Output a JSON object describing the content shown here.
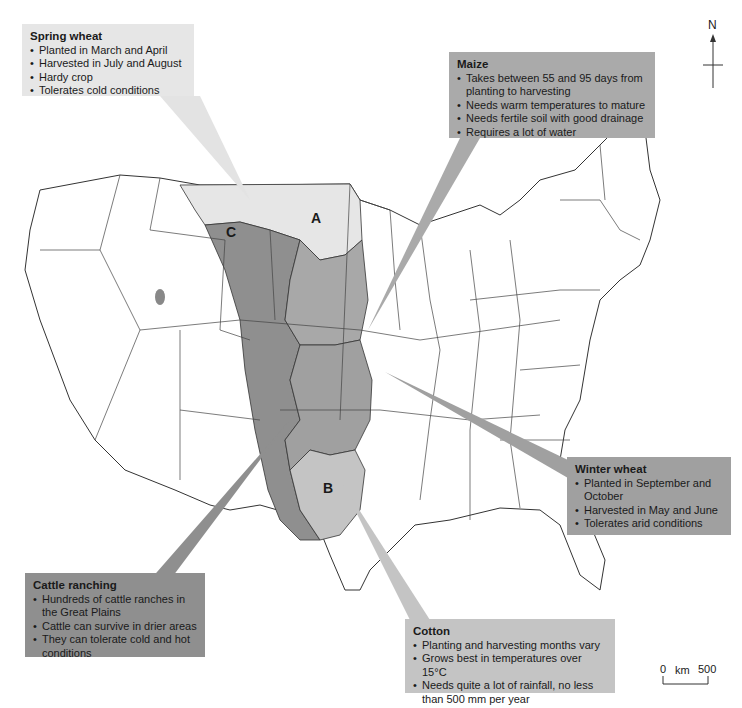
{
  "map": {
    "title": "Agricultural regions of the United States",
    "colors": {
      "land": "#ffffff",
      "border": "#333333",
      "spring_wheat": "#e6e6e6",
      "maize": "#a8a8a8",
      "winter_wheat": "#a0a0a0",
      "cattle": "#8f8f8f",
      "cotton": "#c4c4c4"
    },
    "region_labels": {
      "a": "A",
      "b": "B",
      "c": "C"
    },
    "compass": {
      "label": "N"
    },
    "scale": {
      "start": "0",
      "unit": "km",
      "end": "500"
    }
  },
  "boxes": {
    "spring_wheat": {
      "title": "Spring wheat",
      "items": [
        "Planted in March and April",
        "Harvested in July and August",
        "Hardy crop",
        "Tolerates cold conditions"
      ]
    },
    "maize": {
      "title": "Maize",
      "items": [
        "Takes between 55 and 95 days from planting to harvesting",
        "Needs warm temperatures to mature",
        "Needs fertile soil with good drainage",
        "Requires a lot of water"
      ]
    },
    "winter_wheat": {
      "title": "Winter wheat",
      "items": [
        "Planted in September and October",
        "Harvested in May and June",
        "Tolerates arid conditions"
      ]
    },
    "cattle": {
      "title": "Cattle ranching",
      "items": [
        "Hundreds of cattle ranches in the Great Plains",
        "Cattle can survive in drier areas",
        "They can tolerate cold and hot conditions"
      ]
    },
    "cotton": {
      "title": "Cotton",
      "items": [
        "Planting and harvesting months vary",
        "Grows best in temperatures over 15°C",
        "Needs quite a lot of rainfall, no less than 500 mm per year"
      ]
    }
  }
}
